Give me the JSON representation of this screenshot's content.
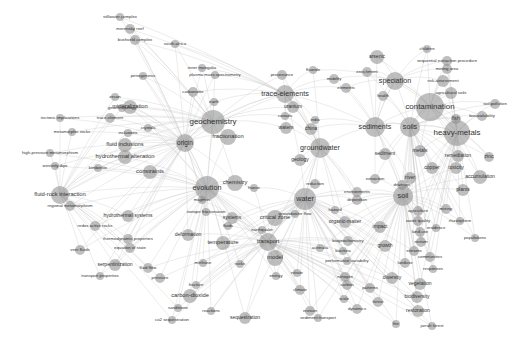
{
  "diagram": {
    "type": "keyword co-occurrence network",
    "edge_color": "#c8c8c8",
    "node_color": "#8a8a8a",
    "label_color": "#333333",
    "nodes": [
      {
        "label": "geochemistry",
        "x": 213,
        "y": 122,
        "r": 12,
        "fs": 11
      },
      {
        "label": "contamination",
        "x": 430,
        "y": 107,
        "r": 14,
        "fs": 11
      },
      {
        "label": "heavy-metals",
        "x": 457,
        "y": 133,
        "r": 13,
        "fs": 11
      },
      {
        "label": "soils",
        "x": 410,
        "y": 127,
        "r": 10,
        "fs": 10
      },
      {
        "label": "sediments",
        "x": 375,
        "y": 127,
        "r": 10,
        "fs": 10
      },
      {
        "label": "speciation",
        "x": 395,
        "y": 81,
        "r": 9,
        "fs": 10
      },
      {
        "label": "trace-elements",
        "x": 285,
        "y": 94,
        "r": 9,
        "fs": 10
      },
      {
        "label": "groundwater",
        "x": 320,
        "y": 148,
        "r": 10,
        "fs": 10
      },
      {
        "label": "water",
        "x": 305,
        "y": 199,
        "r": 11,
        "fs": 10
      },
      {
        "label": "evolution",
        "x": 207,
        "y": 188,
        "r": 12,
        "fs": 10
      },
      {
        "label": "fractionation",
        "x": 228,
        "y": 137,
        "r": 8,
        "fs": 8
      },
      {
        "label": "origin",
        "x": 185,
        "y": 143,
        "r": 9,
        "fs": 9
      },
      {
        "label": "mineralization",
        "x": 130,
        "y": 107,
        "r": 7,
        "fs": 8
      },
      {
        "label": "fluid inclusions",
        "x": 125,
        "y": 145,
        "r": 7,
        "fs": 8
      },
      {
        "label": "hydrothermal alteration",
        "x": 125,
        "y": 157,
        "r": 7,
        "fs": 8
      },
      {
        "label": "fluid-rock interaction",
        "x": 60,
        "y": 195,
        "r": 9,
        "fs": 8
      },
      {
        "label": "constraints",
        "x": 150,
        "y": 172,
        "r": 7,
        "fs": 8
      },
      {
        "label": "chemistry",
        "x": 235,
        "y": 183,
        "r": 8,
        "fs": 8
      },
      {
        "label": "critical zone",
        "x": 275,
        "y": 218,
        "r": 8,
        "fs": 8
      },
      {
        "label": "transport",
        "x": 268,
        "y": 242,
        "r": 9,
        "fs": 8
      },
      {
        "label": "temperature",
        "x": 223,
        "y": 243,
        "r": 7,
        "fs": 8
      },
      {
        "label": "model",
        "x": 275,
        "y": 258,
        "r": 8,
        "fs": 8
      },
      {
        "label": "systems",
        "x": 232,
        "y": 218,
        "r": 6,
        "fs": 7
      },
      {
        "label": "carbon-dioxide",
        "x": 190,
        "y": 296,
        "r": 7,
        "fs": 8
      },
      {
        "label": "sequestration",
        "x": 245,
        "y": 318,
        "r": 6,
        "fs": 7
      },
      {
        "label": "soil",
        "x": 403,
        "y": 196,
        "r": 10,
        "fs": 10
      },
      {
        "label": "sediment",
        "x": 385,
        "y": 154,
        "r": 6,
        "fs": 7
      },
      {
        "label": "metals",
        "x": 420,
        "y": 151,
        "r": 6,
        "fs": 7
      },
      {
        "label": "copper",
        "x": 432,
        "y": 168,
        "r": 6,
        "fs": 7
      },
      {
        "label": "toxicity",
        "x": 456,
        "y": 168,
        "r": 6,
        "fs": 7
      },
      {
        "label": "remediation",
        "x": 458,
        "y": 156,
        "r": 6,
        "fs": 7
      },
      {
        "label": "accumulation",
        "x": 480,
        "y": 177,
        "r": 7,
        "fs": 7
      },
      {
        "label": "plants",
        "x": 463,
        "y": 190,
        "r": 6,
        "fs": 7
      },
      {
        "label": "zinc",
        "x": 489,
        "y": 157,
        "r": 5,
        "fs": 7
      },
      {
        "label": "fish",
        "x": 456,
        "y": 119,
        "r": 5,
        "fs": 7
      },
      {
        "label": "bioavailability",
        "x": 482,
        "y": 116,
        "r": 5,
        "fs": 6
      },
      {
        "label": "soil pollution",
        "x": 495,
        "y": 104,
        "r": 5,
        "fs": 6
      },
      {
        "label": "agricultural soils",
        "x": 451,
        "y": 93,
        "r": 6,
        "fs": 6
      },
      {
        "label": "risk-assessment",
        "x": 443,
        "y": 81,
        "r": 6,
        "fs": 6
      },
      {
        "label": "mining area",
        "x": 447,
        "y": 69,
        "r": 5,
        "fs": 6
      },
      {
        "label": "sequential extraction procedure",
        "x": 447,
        "y": 61,
        "r": 5,
        "fs": 6
      },
      {
        "label": "children",
        "x": 427,
        "y": 49,
        "r": 4,
        "fs": 6
      },
      {
        "label": "arsenic",
        "x": 377,
        "y": 57,
        "r": 7,
        "fs": 7
      },
      {
        "label": "enrichment",
        "x": 367,
        "y": 72,
        "r": 5,
        "fs": 6
      },
      {
        "label": "mobility",
        "x": 334,
        "y": 79,
        "r": 5,
        "fs": 6
      },
      {
        "label": "elements",
        "x": 346,
        "y": 88,
        "r": 5,
        "fs": 6
      },
      {
        "label": "health",
        "x": 383,
        "y": 96,
        "r": 5,
        "fs": 6
      },
      {
        "label": "fluoride",
        "x": 313,
        "y": 70,
        "r": 4,
        "fs": 6
      },
      {
        "label": "provenance",
        "x": 282,
        "y": 75,
        "r": 5,
        "fs": 6
      },
      {
        "label": "uranium",
        "x": 293,
        "y": 107,
        "r": 6,
        "fs": 7
      },
      {
        "label": "canada",
        "x": 285,
        "y": 116,
        "r": 4,
        "fs": 6
      },
      {
        "label": "waters",
        "x": 286,
        "y": 128,
        "r": 6,
        "fs": 7
      },
      {
        "label": "china",
        "x": 311,
        "y": 129,
        "r": 6,
        "fs": 7
      },
      {
        "label": "india",
        "x": 315,
        "y": 120,
        "r": 4,
        "fs": 6
      },
      {
        "label": "geology",
        "x": 300,
        "y": 160,
        "r": 6,
        "fs": 7
      },
      {
        "label": "reduction",
        "x": 315,
        "y": 184,
        "r": 5,
        "fs": 6
      },
      {
        "label": "organic-matter",
        "x": 345,
        "y": 222,
        "r": 6,
        "fs": 7
      },
      {
        "label": "impact",
        "x": 380,
        "y": 227,
        "r": 6,
        "fs": 7
      },
      {
        "label": "growth",
        "x": 385,
        "y": 246,
        "r": 6,
        "fs": 7
      },
      {
        "label": "diversity",
        "x": 392,
        "y": 278,
        "r": 6,
        "fs": 7
      },
      {
        "label": "vegetation",
        "x": 420,
        "y": 284,
        "r": 6,
        "fs": 7
      },
      {
        "label": "biodiversity",
        "x": 417,
        "y": 297,
        "r": 6,
        "fs": 7
      },
      {
        "label": "restoration",
        "x": 418,
        "y": 311,
        "r": 6,
        "fs": 7
      },
      {
        "label": "water quality",
        "x": 418,
        "y": 221,
        "r": 5,
        "fs": 6
      },
      {
        "label": "agriculture",
        "x": 418,
        "y": 211,
        "r": 5,
        "fs": 6
      },
      {
        "label": "land-use",
        "x": 420,
        "y": 232,
        "r": 5,
        "fs": 6
      },
      {
        "label": "stream",
        "x": 421,
        "y": 242,
        "r": 5,
        "fs": 6
      },
      {
        "label": "streams",
        "x": 414,
        "y": 251,
        "r": 5,
        "fs": 6
      },
      {
        "label": "communities",
        "x": 430,
        "y": 257,
        "r": 5,
        "fs": 6
      },
      {
        "label": "landuse",
        "x": 405,
        "y": 263,
        "r": 5,
        "fs": 6
      },
      {
        "label": "responses",
        "x": 433,
        "y": 269,
        "r": 4,
        "fs": 6
      },
      {
        "label": "mixing",
        "x": 446,
        "y": 209,
        "r": 5,
        "fs": 6
      },
      {
        "label": "rhizosphere",
        "x": 460,
        "y": 221,
        "r": 4,
        "fs": 6
      },
      {
        "label": "populations",
        "x": 475,
        "y": 238,
        "r": 4,
        "fs": 6
      },
      {
        "label": "residence",
        "x": 436,
        "y": 228,
        "r": 4,
        "fs": 6
      },
      {
        "label": "forest",
        "x": 378,
        "y": 302,
        "r": 5,
        "fs": 6
      },
      {
        "label": "fire",
        "x": 396,
        "y": 324,
        "r": 4,
        "fs": 6
      },
      {
        "label": "jarrah forest",
        "x": 432,
        "y": 326,
        "r": 4,
        "fs": 6
      },
      {
        "label": "nitrogen",
        "x": 345,
        "y": 277,
        "r": 5,
        "fs": 6
      },
      {
        "label": "carbon",
        "x": 347,
        "y": 285,
        "r": 5,
        "fs": 6
      },
      {
        "label": "patterns",
        "x": 370,
        "y": 288,
        "r": 5,
        "fs": 6
      },
      {
        "label": "scale",
        "x": 344,
        "y": 299,
        "r": 4,
        "fs": 6
      },
      {
        "label": "dynamics",
        "x": 357,
        "y": 309,
        "r": 5,
        "fs": 6
      },
      {
        "label": "climate",
        "x": 300,
        "y": 290,
        "r": 5,
        "fs": 6
      },
      {
        "label": "erosion",
        "x": 310,
        "y": 311,
        "r": 5,
        "fs": 6
      },
      {
        "label": "sediment transport",
        "x": 318,
        "y": 318,
        "r": 4,
        "fs": 6
      },
      {
        "label": "biogeochemistry",
        "x": 348,
        "y": 241,
        "r": 5,
        "fs": 6
      },
      {
        "label": "bacteria",
        "x": 343,
        "y": 251,
        "r": 4,
        "fs": 6
      },
      {
        "label": "performance variability",
        "x": 347,
        "y": 261,
        "r": 4,
        "fs": 6
      },
      {
        "label": "groundwater flow",
        "x": 295,
        "y": 214,
        "r": 4,
        "fs": 6
      },
      {
        "label": "hazard",
        "x": 335,
        "y": 210,
        "r": 4,
        "fs": 6
      },
      {
        "label": "environments",
        "x": 357,
        "y": 192,
        "r": 5,
        "fs": 6
      },
      {
        "label": "deposition",
        "x": 357,
        "y": 200,
        "r": 5,
        "fs": 6
      },
      {
        "label": "river",
        "x": 410,
        "y": 178,
        "r": 6,
        "fs": 7
      },
      {
        "label": "drainage",
        "x": 402,
        "y": 185,
        "r": 5,
        "fs": 6
      },
      {
        "label": "extraction",
        "x": 375,
        "y": 179,
        "r": 5,
        "fs": 6
      },
      {
        "label": "transport",
        "x": 268,
        "y": 242,
        "r": 0,
        "fs": 0
      },
      {
        "label": "earthquake",
        "x": 262,
        "y": 230,
        "r": 4,
        "fs": 6
      },
      {
        "label": "deformation",
        "x": 188,
        "y": 235,
        "r": 6,
        "fs": 7
      },
      {
        "label": "hydrothermal systems",
        "x": 128,
        "y": 216,
        "r": 6,
        "fs": 7
      },
      {
        "label": "thermodynamic properties",
        "x": 128,
        "y": 239,
        "r": 5,
        "fs": 6
      },
      {
        "label": "equation of state",
        "x": 130,
        "y": 248,
        "r": 5,
        "fs": 6
      },
      {
        "label": "serpentinization",
        "x": 115,
        "y": 265,
        "r": 6,
        "fs": 7
      },
      {
        "label": "fluid flow",
        "x": 148,
        "y": 268,
        "r": 5,
        "fs": 6
      },
      {
        "label": "pressure",
        "x": 160,
        "y": 278,
        "r": 5,
        "fs": 6
      },
      {
        "label": "transport properties",
        "x": 100,
        "y": 276,
        "r": 4,
        "fs": 6
      },
      {
        "label": "redox active rocks",
        "x": 95,
        "y": 226,
        "r": 5,
        "fs": 6
      },
      {
        "label": "regional metamorphism",
        "x": 70,
        "y": 206,
        "r": 5,
        "fs": 6
      },
      {
        "label": "vent fluids",
        "x": 80,
        "y": 250,
        "r": 5,
        "fs": 6
      },
      {
        "label": "high-pressure metamorphism",
        "x": 50,
        "y": 153,
        "r": 4,
        "fs": 6
      },
      {
        "label": "westerly dips",
        "x": 55,
        "y": 166,
        "r": 4,
        "fs": 6
      },
      {
        "label": "metamorphic rocks",
        "x": 72,
        "y": 132,
        "r": 4,
        "fs": 6
      },
      {
        "label": "tectonic implications",
        "x": 60,
        "y": 118,
        "r": 4,
        "fs": 6
      },
      {
        "label": "trace-element",
        "x": 110,
        "y": 118,
        "r": 5,
        "fs": 6
      },
      {
        "label": "geochronology",
        "x": 122,
        "y": 108,
        "r": 4,
        "fs": 6
      },
      {
        "label": "zircon",
        "x": 115,
        "y": 97,
        "r": 4,
        "fs": 6
      },
      {
        "label": "inclusions",
        "x": 128,
        "y": 133,
        "r": 4,
        "fs": 6
      },
      {
        "label": "crystals",
        "x": 148,
        "y": 128,
        "r": 4,
        "fs": 6
      },
      {
        "label": "kimberlite",
        "x": 98,
        "y": 168,
        "r": 4,
        "fs": 6
      },
      {
        "label": "petrogenesis",
        "x": 143,
        "y": 76,
        "r": 4,
        "fs": 6
      },
      {
        "label": "inner mongolia",
        "x": 202,
        "y": 68,
        "r": 4,
        "fs": 6
      },
      {
        "label": "plasma mass spectrometry",
        "x": 215,
        "y": 75,
        "r": 4,
        "fs": 6
      },
      {
        "label": "south africa",
        "x": 175,
        "y": 44,
        "r": 4,
        "fs": 6
      },
      {
        "label": "bushveld complex",
        "x": 135,
        "y": 40,
        "r": 5,
        "fs": 6
      },
      {
        "label": "merensky reef",
        "x": 130,
        "y": 29,
        "r": 5,
        "fs": 6
      },
      {
        "label": "stillwater complex",
        "x": 120,
        "y": 17,
        "r": 4,
        "fs": 6
      },
      {
        "label": "carbonatite",
        "x": 193,
        "y": 92,
        "r": 5,
        "fs": 6
      },
      {
        "label": "earth",
        "x": 214,
        "y": 102,
        "r": 4,
        "fs": 6
      },
      {
        "label": "sequestration",
        "x": 245,
        "y": 318,
        "r": 0,
        "fs": 0
      },
      {
        "label": "co2 sequestration",
        "x": 172,
        "y": 320,
        "r": 4,
        "fs": 6
      },
      {
        "label": "sandstone",
        "x": 178,
        "y": 308,
        "r": 4,
        "fs": 6
      },
      {
        "label": "fracture",
        "x": 196,
        "y": 285,
        "r": 4,
        "fs": 6
      },
      {
        "label": "reactions",
        "x": 211,
        "y": 311,
        "r": 4,
        "fs": 6
      },
      {
        "label": "methane",
        "x": 203,
        "y": 263,
        "r": 4,
        "fs": 6
      },
      {
        "label": "rocks",
        "x": 240,
        "y": 264,
        "r": 4,
        "fs": 6
      },
      {
        "label": "fluids",
        "x": 228,
        "y": 226,
        "r": 4,
        "fs": 6
      },
      {
        "label": "energy",
        "x": 276,
        "y": 276,
        "r": 4,
        "fs": 6
      },
      {
        "label": "nitrate",
        "x": 297,
        "y": 273,
        "r": 4,
        "fs": 6
      },
      {
        "label": "australia",
        "x": 320,
        "y": 248,
        "r": 4,
        "fs": 6
      },
      {
        "label": "france",
        "x": 254,
        "y": 188,
        "r": 4,
        "fs": 6
      },
      {
        "label": "magmas",
        "x": 202,
        "y": 200,
        "r": 4,
        "fs": 6
      },
      {
        "label": "isotope fractionation",
        "x": 206,
        "y": 212,
        "r": 4,
        "fs": 6
      }
    ]
  }
}
